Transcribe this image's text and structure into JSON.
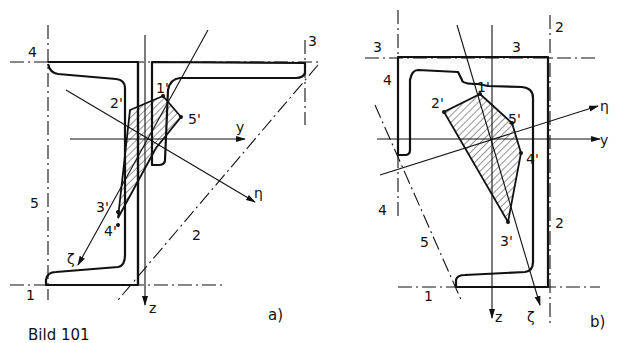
{
  "figure": {
    "caption": "Bild 101",
    "panels": [
      {
        "id": "a",
        "label": "a)",
        "axes": {
          "y": "y",
          "z": "z",
          "eta": "η",
          "zeta": "ζ"
        },
        "points": [
          "1'",
          "2'",
          "3'",
          "4'",
          "5'"
        ],
        "lines": [
          "1",
          "2",
          "3",
          "4",
          "5"
        ]
      },
      {
        "id": "b",
        "label": "b)",
        "axes": {
          "y": "y",
          "z": "z",
          "eta": "η",
          "zeta": "ζ"
        },
        "points": [
          "1'",
          "2'",
          "3'",
          "4'",
          "5'"
        ],
        "lines": [
          "1",
          "2",
          "3",
          "3b",
          "4",
          "4b",
          "5"
        ],
        "line_labels": {
          "1": "1",
          "2": "2",
          "2b": "2",
          "3": "3",
          "3b": "3",
          "4": "4",
          "4b": "4",
          "5": "5"
        }
      }
    ]
  }
}
